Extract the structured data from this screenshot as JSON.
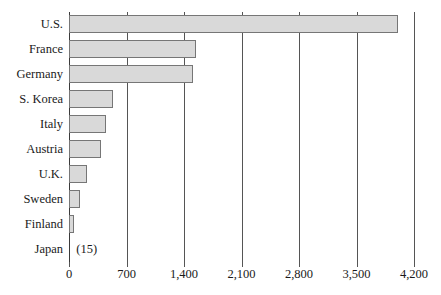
{
  "chart_data": {
    "type": "bar",
    "orientation": "horizontal",
    "title": "",
    "subtitle": "",
    "xlabel": "",
    "ylabel": "",
    "xlim": [
      0,
      4200
    ],
    "xticks": [
      0,
      700,
      1400,
      2100,
      2800,
      3500,
      4200
    ],
    "xtick_labels": [
      "0",
      "700",
      "1,400",
      "2,100",
      "2,800",
      "3,500",
      "4,200"
    ],
    "grid": true,
    "grid_axis": "x",
    "legend": false,
    "legend_position": "none",
    "categories": [
      "U.S.",
      "France",
      "Germany",
      "S. Korea",
      "Italy",
      "Austria",
      "U.K.",
      "Sweden",
      "Finland",
      "Japan"
    ],
    "values": [
      4000,
      1550,
      1510,
      535,
      450,
      390,
      220,
      135,
      60,
      15
    ],
    "annotations": [
      {
        "category": "Japan",
        "text": "(15)"
      }
    ],
    "colors": {
      "bar_fill": "#d9d9d9",
      "bar_border": "#767676",
      "gridline": "#555555",
      "axis": "#3a3a3a",
      "text": "#1a1a1a",
      "background": "#ffffff"
    }
  }
}
